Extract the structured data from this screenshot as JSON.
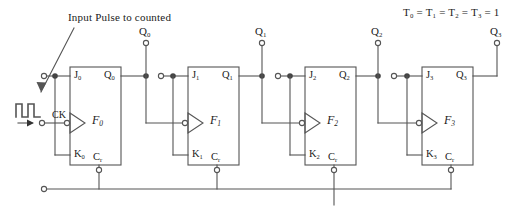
{
  "diagram": {
    "title": "Input Pulse to counted",
    "t_condition": "T0 = T1 = T2 = T3 = 1",
    "t_condition_parts": {
      "t0": "T",
      "t0sub": "0",
      "t1": "T",
      "t1sub": "1",
      "t2": "T",
      "t2sub": "2",
      "t3": "T",
      "t3sub": "3",
      "value": "1",
      "eq": "="
    },
    "clock_label": "CK",
    "line_color": "#555555",
    "text_color": "#1a1a1a",
    "background": "#ffffff"
  },
  "flipflops": [
    {
      "name": "F",
      "name_sub": "0",
      "j": "J",
      "j_sub": "0",
      "k": "K",
      "k_sub": "0",
      "q": "Q",
      "q_sub": "0",
      "cr": "C",
      "cr_sub": "r",
      "output_terminal": "Q",
      "output_terminal_sub": "0"
    },
    {
      "name": "F",
      "name_sub": "1",
      "j": "J",
      "j_sub": "1",
      "k": "K",
      "k_sub": "1",
      "q": "Q",
      "q_sub": "1",
      "cr": "C",
      "cr_sub": "r",
      "output_terminal": "Q",
      "output_terminal_sub": "1"
    },
    {
      "name": "F",
      "name_sub": "2",
      "j": "J",
      "j_sub": "2",
      "k": "K",
      "k_sub": "2",
      "q": "Q",
      "q_sub": "2",
      "cr": "C",
      "cr_sub": "r",
      "output_terminal": "Q",
      "output_terminal_sub": "2"
    },
    {
      "name": "F",
      "name_sub": "3",
      "j": "J",
      "j_sub": "3",
      "k": "K",
      "k_sub": "3",
      "q": "Q",
      "q_sub": "3",
      "cr": "C",
      "cr_sub": "r",
      "output_terminal": "Q",
      "output_terminal_sub": "3"
    }
  ]
}
